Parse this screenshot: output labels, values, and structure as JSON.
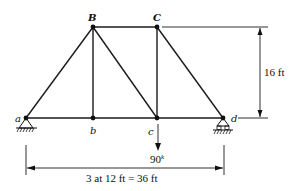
{
  "diagram": {
    "type": "truss",
    "nodes": {
      "a": "a",
      "b": "b",
      "c": "c",
      "d": "d",
      "B": "B",
      "C": "C"
    },
    "load": {
      "node": "c",
      "value": "90",
      "unit_superscript": "k"
    },
    "height_dimension": "16 ft",
    "span_dimension": "3 at 12 ft = 36 ft",
    "supports": {
      "a": "pin",
      "d": "roller"
    }
  }
}
